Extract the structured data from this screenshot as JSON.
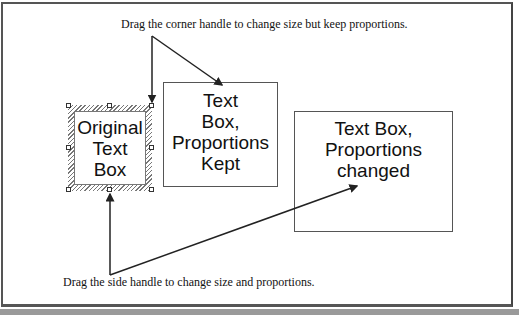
{
  "captions": {
    "top": "Drag the corner handle to change size but keep proportions.",
    "bottom": "Drag the side handle to change size and proportions."
  },
  "boxes": {
    "original": {
      "lines": [
        "Original",
        "Text",
        "Box"
      ],
      "selected": true
    },
    "proportions_kept": {
      "lines": [
        "Text",
        "Box,",
        "Proportions",
        "Kept"
      ]
    },
    "proportions_changed": {
      "lines": [
        "Text Box,",
        "Proportions",
        "changed"
      ]
    }
  },
  "handles": [
    "top-left",
    "top-center",
    "top-right",
    "middle-left",
    "middle-right",
    "bottom-left",
    "bottom-center",
    "bottom-right"
  ],
  "colors": {
    "frame": "#555555",
    "band": "#9a9a9a",
    "line": "#222222",
    "hatch": "#777777"
  }
}
